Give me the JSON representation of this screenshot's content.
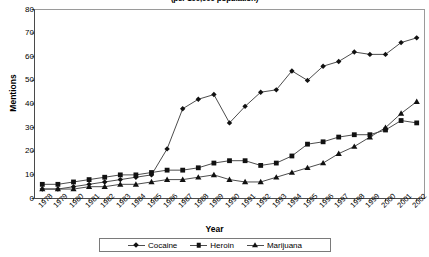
{
  "chart_data": {
    "type": "line",
    "title": "(per 100,000 population)",
    "xlabel": "Year",
    "ylabel": "Mentions",
    "ylim": [
      0,
      80
    ],
    "ytick_step": 10,
    "yticks": [
      0,
      10,
      20,
      30,
      40,
      50,
      60,
      70,
      80
    ],
    "grid": false,
    "legend_position": "bottom",
    "categories": [
      "1978",
      "1979",
      "1980",
      "1981",
      "1982",
      "1983",
      "1984",
      "1985",
      "1986",
      "1987",
      "1988",
      "1989",
      "1990",
      "1991",
      "1992",
      "1993",
      "1994",
      "1995",
      "1996",
      "1997",
      "1998",
      "1999",
      "2000",
      "2001",
      "2002"
    ],
    "series": [
      {
        "name": "Cocaine",
        "marker": "diamond",
        "values": [
          4,
          4,
          5,
          6,
          7,
          8,
          9,
          10,
          21,
          38,
          42,
          44,
          32,
          39,
          45,
          46,
          54,
          50,
          56,
          58,
          62,
          61,
          61,
          66,
          68
        ]
      },
      {
        "name": "Heroin",
        "marker": "square",
        "values": [
          6,
          6,
          7,
          8,
          9,
          10,
          10,
          11,
          12,
          12,
          13,
          15,
          16,
          16,
          14,
          15,
          18,
          23,
          24,
          26,
          27,
          27,
          29,
          33,
          32
        ]
      },
      {
        "name": "Marijuana",
        "marker": "triangle",
        "values": [
          4,
          4,
          4,
          5,
          5,
          6,
          6,
          7,
          8,
          8,
          9,
          10,
          8,
          7,
          7,
          9,
          11,
          13,
          15,
          19,
          22,
          26,
          30,
          36,
          41
        ]
      }
    ]
  },
  "legend": {
    "items": [
      {
        "label": "Cocaine"
      },
      {
        "label": "Heroin"
      },
      {
        "label": "Marijuana"
      }
    ]
  },
  "colors": {
    "line": "#4d4d4d",
    "marker": "#111111",
    "frame": "#9a9a9a",
    "axis": "#4a4a4a",
    "background": "#ffffff"
  }
}
